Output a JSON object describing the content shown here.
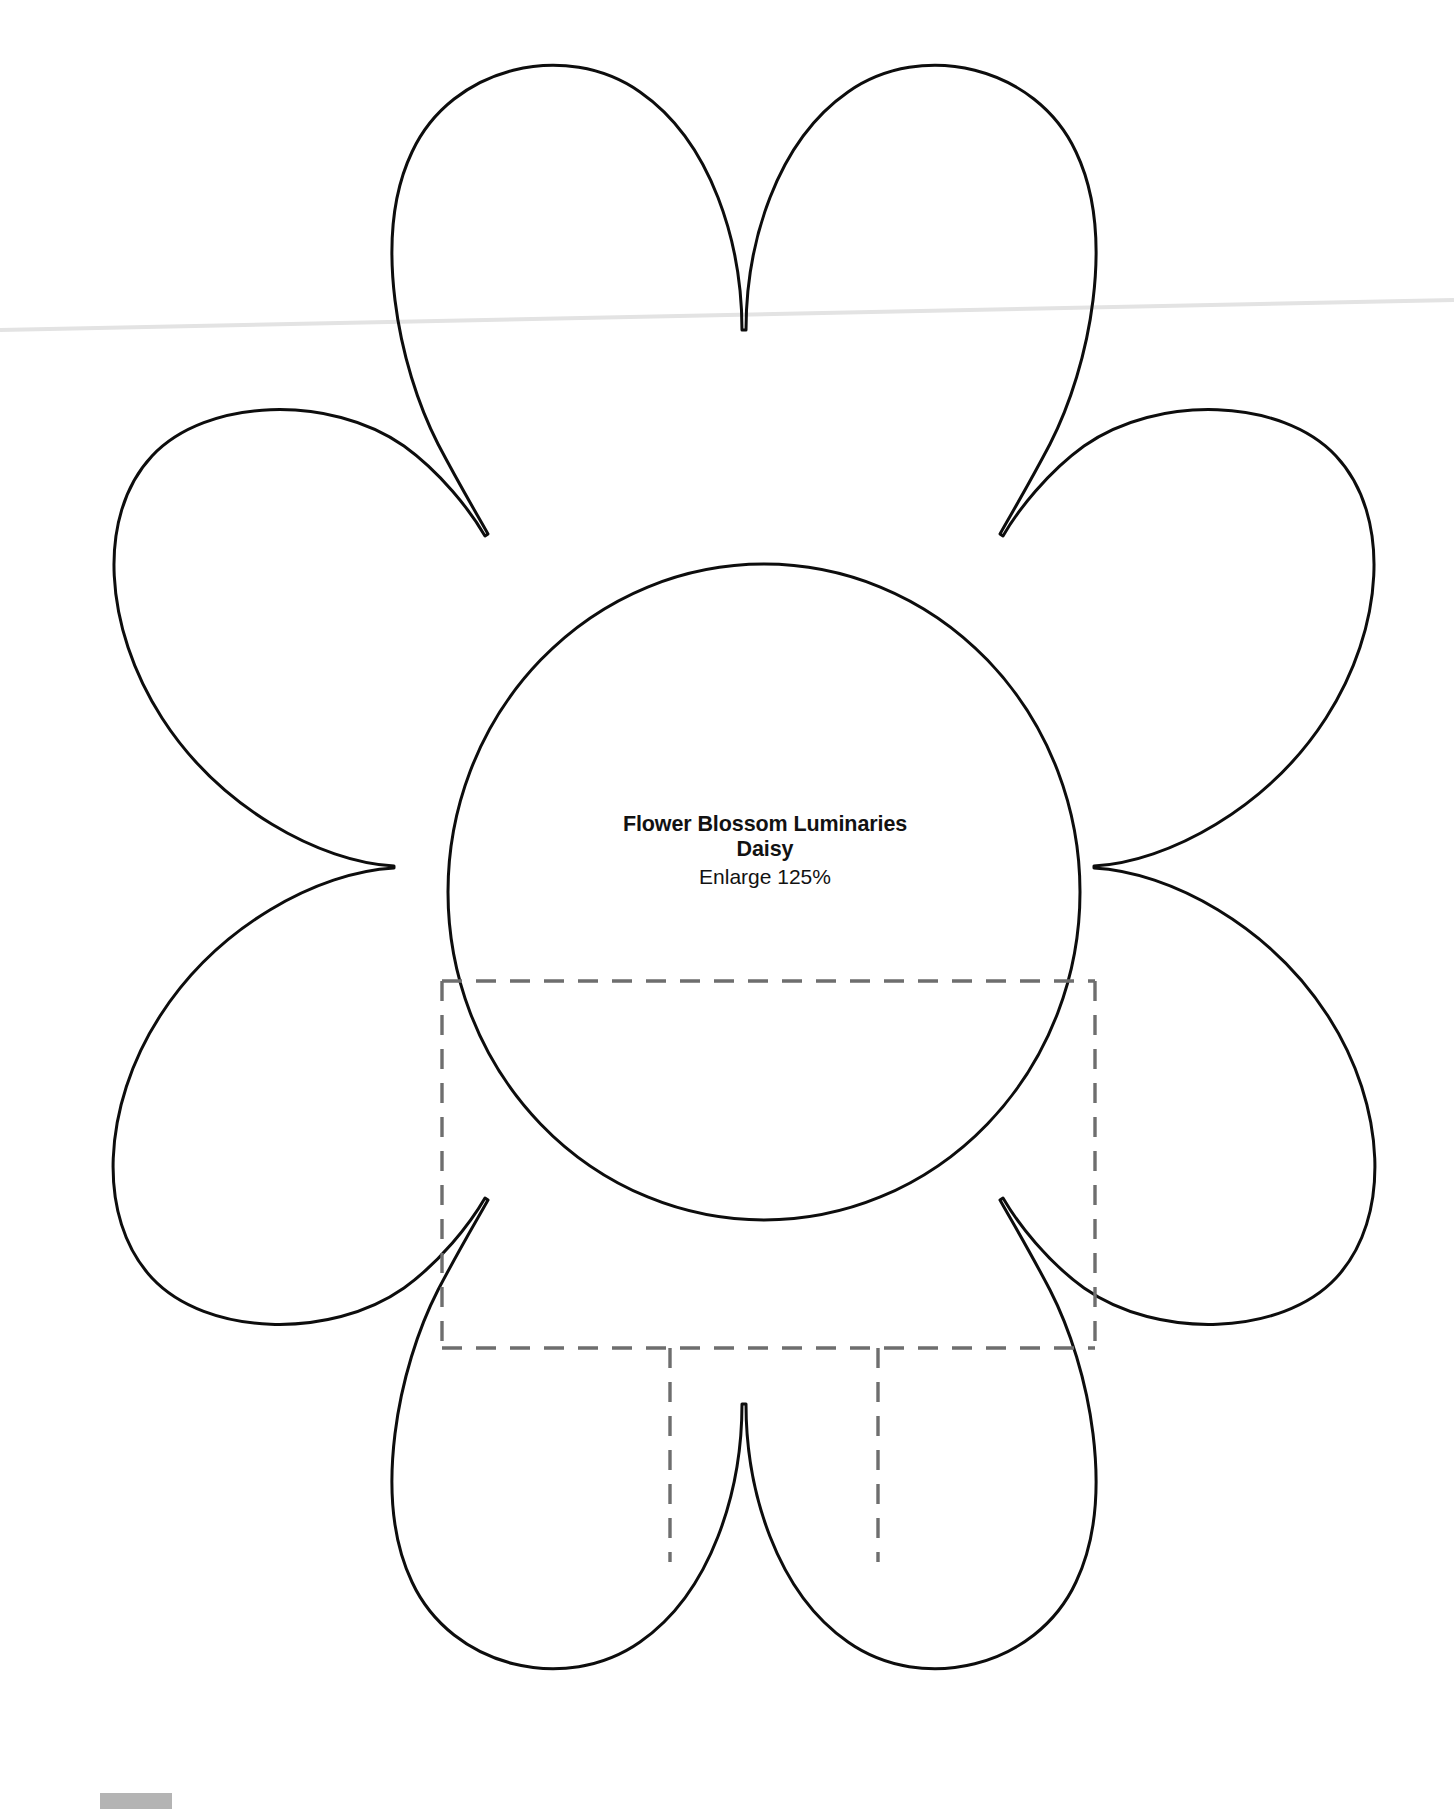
{
  "document": {
    "kind": "craft-template-scan",
    "background_color": "#ffffff",
    "ink_color": "#0d0d0d",
    "fold_line_color": "#6e6e6e",
    "artifact_color": "#b4b4b4"
  },
  "label": {
    "title": "Flower Blossom Luminaries",
    "subtitle": "Daisy",
    "note": "Enlarge 125%"
  },
  "template": {
    "shape_name": "daisy-flower-petal-outline",
    "petal_count": 6,
    "center_circle": {
      "cx": 764,
      "cy": 892,
      "rx": 316,
      "ry": 328
    },
    "fold_rectangle": {
      "left": 442,
      "top": 981,
      "right": 1095,
      "bottom": 1348
    },
    "fold_tabs": [
      {
        "x": 670,
        "y_top": 1348,
        "y_bottom": 1562
      },
      {
        "x": 878,
        "y_top": 1348,
        "y_bottom": 1562
      }
    ]
  }
}
